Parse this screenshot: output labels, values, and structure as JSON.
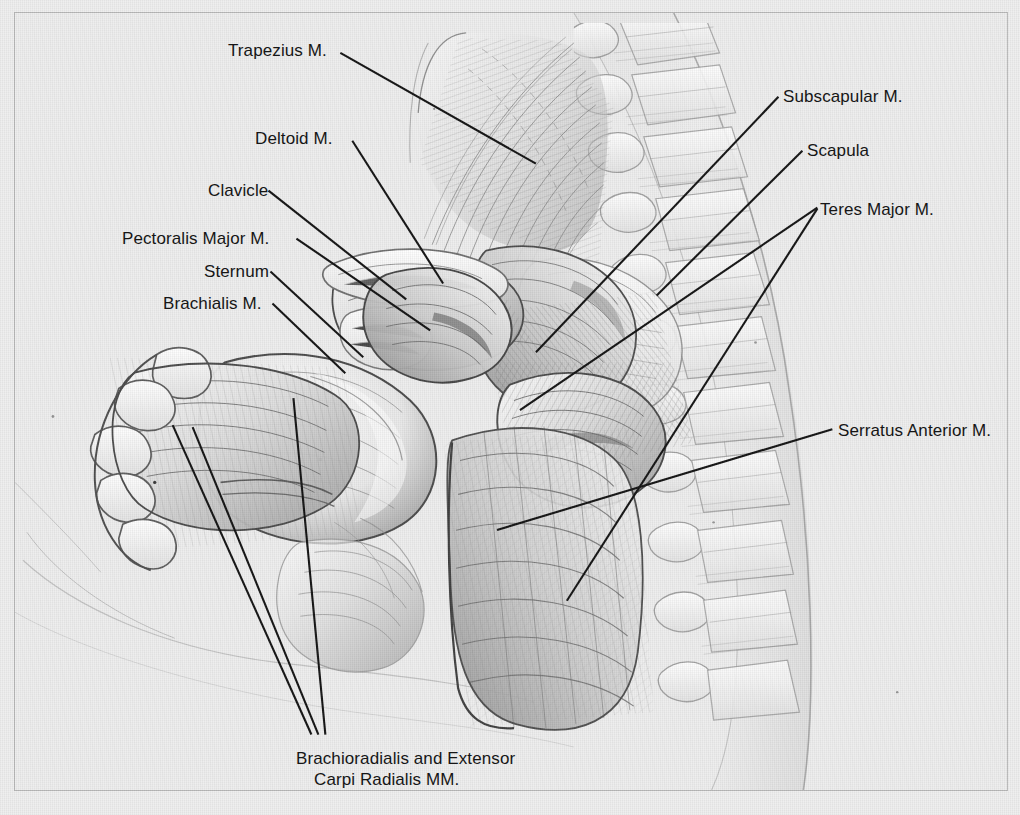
{
  "plate": {
    "title": "Muscles of the Shoulder and Upper Arm — Anterior Dissection",
    "background_color": "#efefef",
    "frame_color": "#b9b9b9",
    "ink_color": "#161616",
    "label_font_size_px": 17
  },
  "labels": [
    {
      "id": "trapezius",
      "text": "Trapezius M.",
      "x": 228,
      "y": 40,
      "align": "left"
    },
    {
      "id": "subscapular",
      "text": "Subscapular M.",
      "x": 783,
      "y": 86,
      "align": "left"
    },
    {
      "id": "deltoid",
      "text": "Deltoid M.",
      "x": 255,
      "y": 128,
      "align": "left"
    },
    {
      "id": "scapula",
      "text": "Scapula",
      "x": 807,
      "y": 140,
      "align": "left"
    },
    {
      "id": "clavicle",
      "text": "Clavicle",
      "x": 208,
      "y": 180,
      "align": "left"
    },
    {
      "id": "teres-major",
      "text": "Teres Major M.",
      "x": 820,
      "y": 199,
      "align": "left"
    },
    {
      "id": "pectoralis-major",
      "text": "Pectoralis Major M.",
      "x": 122,
      "y": 228,
      "align": "left"
    },
    {
      "id": "sternum",
      "text": "Sternum",
      "x": 204,
      "y": 261,
      "align": "left"
    },
    {
      "id": "brachialis",
      "text": "Brachialis M.",
      "x": 163,
      "y": 293,
      "align": "left"
    },
    {
      "id": "serratus-anterior",
      "text": "Serratus Anterior M.",
      "x": 838,
      "y": 420,
      "align": "left"
    }
  ],
  "caption": {
    "id": "brachioradialis-extensor-carpi-radialis",
    "line1": "Brachioradialis and Extensor",
    "line2": "Carpi Radialis MM.",
    "x": 296,
    "y": 748
  },
  "leaders": [
    {
      "id": "leader-trapezius",
      "points": "340,52 536,163"
    },
    {
      "id": "leader-subscapular",
      "points": "779,96 536,352"
    },
    {
      "id": "leader-scapula",
      "points": "803,150 657,295"
    },
    {
      "id": "leader-teres-major-upper",
      "points": "818,207 520,410"
    },
    {
      "id": "leader-teres-major-lower",
      "points": "818,208 567,601"
    },
    {
      "id": "leader-deltoid",
      "points": "352,140 443,283"
    },
    {
      "id": "leader-clavicle",
      "points": "268,190 406,299"
    },
    {
      "id": "leader-pectoralis-major",
      "points": "296,238 430,330"
    },
    {
      "id": "leader-sternum",
      "points": "270,271 363,357"
    },
    {
      "id": "leader-brachialis",
      "points": "272,303 345,373"
    },
    {
      "id": "leader-serratus-anterior",
      "points": "833,429 497,530"
    },
    {
      "id": "leader-brachioradialis-1",
      "points": "311,735 172,425"
    },
    {
      "id": "leader-brachioradialis-2",
      "points": "318,735 192,427"
    },
    {
      "id": "leader-brachioradialis-3",
      "points": "325,735 293,398"
    }
  ],
  "structures": [
    {
      "id": "vertebral-column",
      "name": "Vertebral column with spinous processes"
    },
    {
      "id": "rib-cage",
      "name": "Rib cage, posterolateral ribs"
    },
    {
      "id": "trapezius-muscle",
      "name": "Trapezius muscle fan"
    },
    {
      "id": "scapula-bone",
      "name": "Scapula"
    },
    {
      "id": "subscapular-muscle",
      "name": "Subscapular muscle"
    },
    {
      "id": "teres-major-muscle",
      "name": "Teres major muscle"
    },
    {
      "id": "serratus-muscle",
      "name": "Serratus anterior muscle slips"
    },
    {
      "id": "clavicle-bone",
      "name": "Clavicle"
    },
    {
      "id": "sternum-bone",
      "name": "Sternum"
    },
    {
      "id": "deltoid-muscle",
      "name": "Deltoid muscle"
    },
    {
      "id": "pectoralis-muscle",
      "name": "Pectoralis major muscle"
    },
    {
      "id": "humerus-arm",
      "name": "Upper arm with brachialis"
    },
    {
      "id": "forearm-hand",
      "name": "Forearm and hand with digits"
    },
    {
      "id": "torso-contour",
      "name": "Torso outline"
    }
  ]
}
